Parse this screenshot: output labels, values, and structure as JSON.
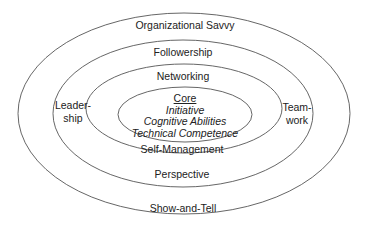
{
  "diagram": {
    "type": "concentric-ellipses",
    "rings": [
      {
        "name": "outer",
        "top_label": "Organizational Savvy",
        "bottom_label": "Show-and-Tell"
      },
      {
        "name": "second",
        "top_label": "Followership",
        "bottom_label": "Perspective",
        "left_label_line1": "Leader-",
        "left_label_line2": "ship",
        "right_label_line1": "Team-",
        "right_label_line2": "work"
      },
      {
        "name": "third",
        "top_label": "Networking",
        "bottom_label": "Self-Management"
      }
    ],
    "core": {
      "title": "Core",
      "items": [
        "Initiative",
        "Cognitive Abilities",
        "Technical Competence"
      ]
    },
    "stroke_color": "#555555"
  }
}
